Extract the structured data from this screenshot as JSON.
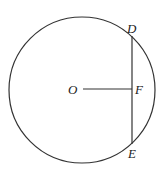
{
  "diagram": {
    "circle": {
      "cx": 82,
      "cy": 90,
      "r": 73,
      "stroke": "#333333"
    },
    "chord": {
      "x1": 132,
      "y1": 36,
      "x2": 132,
      "y2": 144,
      "stroke": "#333333"
    },
    "radius_segment": {
      "x1": 83,
      "y1": 89,
      "x2": 132,
      "y2": 89,
      "stroke": "#333333"
    },
    "labels": {
      "O": {
        "text": "O",
        "x": 68,
        "y": 94
      },
      "F": {
        "text": "F",
        "x": 135,
        "y": 94
      },
      "D": {
        "text": "D",
        "x": 127,
        "y": 33
      },
      "E": {
        "text": "E",
        "x": 128,
        "y": 158
      }
    }
  }
}
